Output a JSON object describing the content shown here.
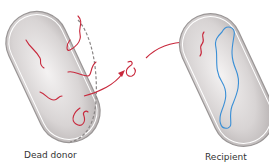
{
  "labels": {
    "donor": "Dead donor",
    "recipient": "Recipient"
  },
  "colors": {
    "dna_donor": "#c8283c",
    "dna_recipient": "#3a8fd6",
    "cell_fill": "#d8d4d4",
    "cell_outline": "#8a8686",
    "arrow": "#c8283c"
  },
  "diagram": {
    "elements": [
      "donor-cell",
      "donor-dna-fragments",
      "released-dna-fragment",
      "arrows",
      "recipient-cell",
      "recipient-chromosome",
      "incoming-dna-fragment"
    ]
  }
}
